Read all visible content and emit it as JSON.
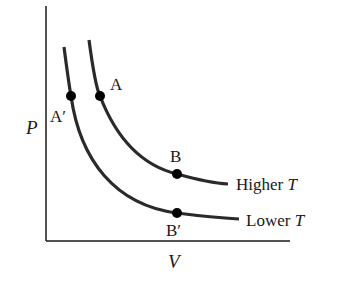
{
  "diagram": {
    "type": "pressure-volume isotherms",
    "axes": {
      "y_label": "P",
      "x_label": "V"
    },
    "curves": [
      {
        "name": "Higher T",
        "label_prefix": "Higher ",
        "label_var": "T",
        "points": [
          {
            "label": "A"
          },
          {
            "label": "B"
          }
        ]
      },
      {
        "name": "Lower T",
        "label_prefix": "Lower ",
        "label_var": "T",
        "points": [
          {
            "label": "A′"
          },
          {
            "label": "B′"
          }
        ]
      }
    ],
    "colors": {
      "axis": "#1a1a1a",
      "curve": "#2a2a2a",
      "point": "#000000",
      "background": "#ffffff"
    }
  }
}
